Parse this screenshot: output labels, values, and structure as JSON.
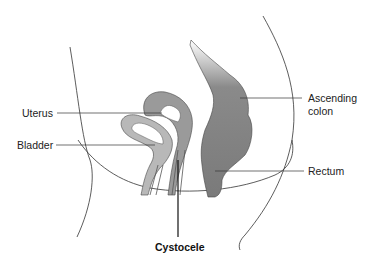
{
  "diagram": {
    "title": "Cystocele",
    "labels": {
      "uterus": "Uterus",
      "bladder": "Bladder",
      "ascending_colon_line1": "Ascending",
      "ascending_colon_line2": "colon",
      "rectum": "Rectum",
      "cystocele": "Cystocele"
    },
    "colors": {
      "colon_fill": "#7a7a7a",
      "uterus_fill": "#9a9a9a",
      "bladder_fill": "#b8b8b8",
      "lumen_fill": "#ffffff",
      "outline": "#333333"
    }
  }
}
